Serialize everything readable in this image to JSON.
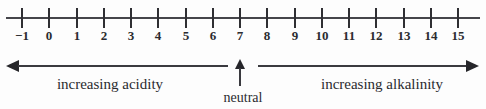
{
  "figure": {
    "kind": "ph-scale-number-line",
    "background_color": "#fdfdfd",
    "ink_color": "#2b2b2f"
  },
  "axis": {
    "name": "ph-number-line",
    "min": -1,
    "max": 15,
    "tick_labels": [
      "−1",
      "0",
      "1",
      "2",
      "3",
      "4",
      "5",
      "6",
      "7",
      "8",
      "9",
      "10",
      "11",
      "12",
      "13",
      "14",
      "15"
    ],
    "tick_values": [
      -1,
      0,
      1,
      2,
      3,
      4,
      5,
      6,
      7,
      8,
      9,
      10,
      11,
      12,
      13,
      14,
      15
    ],
    "first_tick_x": 22,
    "tick_spacing": 27.25,
    "line_y": 18
  },
  "annotations": {
    "left_arrow": {
      "label": "increasing acidity",
      "direction": "left",
      "from_value": 7,
      "to_value": -1,
      "label_center_x": 110
    },
    "right_arrow": {
      "label": "increasing alkalinity",
      "direction": "right",
      "from_value": 7,
      "to_value": 15,
      "label_center_x": 382
    },
    "neutral_pointer": {
      "label": "neutral",
      "points_to_value": 7,
      "direction": "up",
      "label_center_x": 243
    }
  }
}
